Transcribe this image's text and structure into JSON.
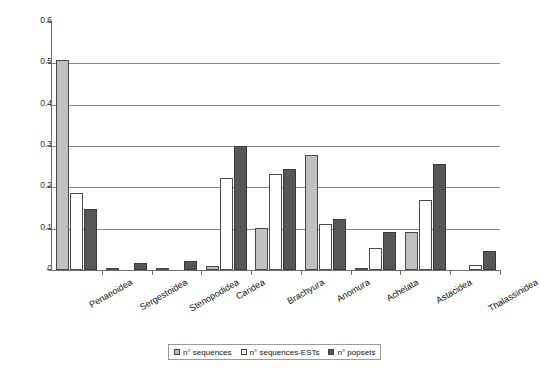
{
  "chart_data": {
    "type": "bar",
    "title": "",
    "subtitle": "",
    "xlabel": "",
    "ylabel": "",
    "ylim": [
      0,
      0.6
    ],
    "yticks": [
      0,
      0.1,
      0.2,
      0.3,
      0.4,
      0.5,
      0.6
    ],
    "ytick_labels": [
      "0",
      "0.1",
      "0.2",
      "0.3",
      "0.4",
      "0.5",
      "0.6"
    ],
    "grid": true,
    "grid_axis": "y",
    "legend_position": "bottom",
    "categories": [
      "Penaeoidea",
      "Sergestoidea",
      "Stenopodidea",
      "Caridea",
      "Brachyura",
      "Anomura",
      "Achelata",
      "Astacidea",
      "Thalassinidea"
    ],
    "series": [
      {
        "name": "n° sequences",
        "color": "#c0c0c0",
        "values": [
          0.508,
          0.003,
          0.002,
          0.01,
          0.102,
          0.279,
          0.003,
          0.091,
          0.0
        ]
      },
      {
        "name": "n° sequences-ESTs",
        "color": "#ffffff",
        "values": [
          0.186,
          0.0,
          0.0,
          0.223,
          0.233,
          0.112,
          0.054,
          0.17,
          0.012
        ]
      },
      {
        "name": "n° popsets",
        "color": "#575757",
        "values": [
          0.147,
          0.016,
          0.023,
          0.299,
          0.244,
          0.124,
          0.092,
          0.257,
          0.046
        ]
      }
    ]
  },
  "legend": {
    "items": [
      {
        "label": "n° sequences"
      },
      {
        "label": "n° sequences-ESTs"
      },
      {
        "label": "n° popsets"
      }
    ]
  },
  "colors": {
    "series_1": "#c0c0c0",
    "series_2": "#ffffff",
    "series_3": "#575757",
    "axis": "#6f6f6f",
    "grid": "#8a8a8a",
    "background": "#ffffff"
  }
}
